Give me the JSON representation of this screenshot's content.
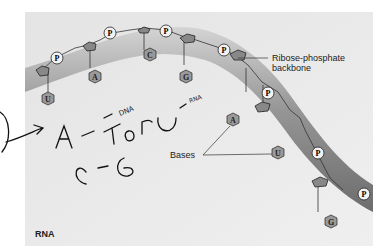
{
  "diagram": {
    "title_label": "RNA",
    "backbone_label_line1": "Ribose-phosphate",
    "backbone_label_line2": "backbone",
    "bases_label": "Bases",
    "phosphate_symbol": "P",
    "nucleotides": [
      {
        "base": "U"
      },
      {
        "base": "A"
      },
      {
        "base": "C"
      },
      {
        "base": "G"
      },
      {
        "base": "A"
      },
      {
        "base": "U"
      },
      {
        "base": "G"
      }
    ],
    "handwritten_notes": {
      "line1": "A - T or U",
      "annotation_dna": "DNA",
      "annotation_rna": "RNA",
      "line2": "C - G"
    },
    "colors": {
      "panel_bg": "#ebebeb",
      "ribbon_dark": "#6f6f6f",
      "ribbon_light": "#bdbdbd",
      "sugar_fill": "#8a8a8a",
      "base_fill": "#9a9a9a",
      "phosphate_fill": "#f2f2f2",
      "ink": "#222222"
    }
  }
}
